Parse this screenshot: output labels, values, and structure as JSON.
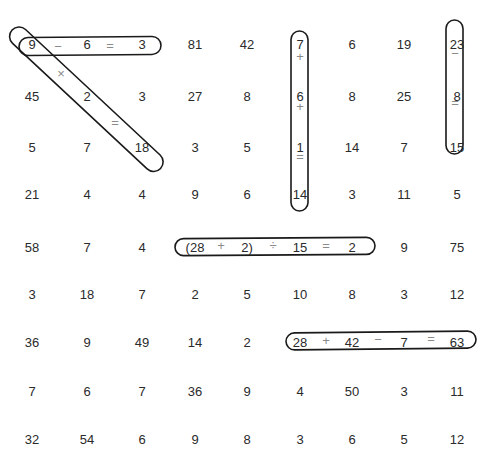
{
  "puzzle": {
    "type": "number-search-equations",
    "columns_x": [
      32,
      87,
      142,
      195,
      247,
      300,
      352,
      404,
      457
    ],
    "rows_y": [
      45,
      97,
      148,
      195,
      248,
      295,
      343,
      392,
      440
    ],
    "grid": [
      [
        "9",
        "6",
        "3",
        "81",
        "42",
        "7",
        "6",
        "19",
        "23"
      ],
      [
        "45",
        "2",
        "3",
        "27",
        "8",
        "6",
        "8",
        "25",
        "8"
      ],
      [
        "5",
        "7",
        "18",
        "3",
        "5",
        "1",
        "14",
        "7",
        "15"
      ],
      [
        "21",
        "4",
        "4",
        "9",
        "6",
        "14",
        "3",
        "11",
        "5"
      ],
      [
        "58",
        "7",
        "4",
        "(28",
        "2)",
        "15",
        "2",
        "9",
        "75"
      ],
      [
        "3",
        "18",
        "7",
        "2",
        "5",
        "10",
        "8",
        "3",
        "12"
      ],
      [
        "36",
        "9",
        "49",
        "14",
        "2",
        "28",
        "42",
        "7",
        "63"
      ],
      [
        "7",
        "6",
        "7",
        "36",
        "9",
        "4",
        "50",
        "3",
        "11"
      ],
      [
        "32",
        "54",
        "6",
        "9",
        "8",
        "3",
        "6",
        "5",
        "12"
      ]
    ],
    "found_equations": [
      {
        "id": "eq-1",
        "text": "9 − 6 = 3",
        "direction": "horizontal",
        "operators": [
          {
            "symbol": "−",
            "x": 58,
            "y": 47
          },
          {
            "symbol": "=",
            "x": 110,
            "y": 46
          }
        ]
      },
      {
        "id": "eq-2",
        "text": "9 × 2 = 18",
        "direction": "diagonal",
        "operators": [
          {
            "symbol": "×",
            "x": 61,
            "y": 74
          },
          {
            "symbol": "=",
            "x": 115,
            "y": 123
          }
        ]
      },
      {
        "id": "eq-3",
        "text": "7 + 6 + 1 = 14",
        "direction": "vertical",
        "operators": [
          {
            "symbol": "+",
            "x": 300,
            "y": 57
          },
          {
            "symbol": "+",
            "x": 300,
            "y": 107
          },
          {
            "symbol": "=",
            "x": 300,
            "y": 157
          }
        ]
      },
      {
        "id": "eq-4",
        "text": "23 − 8 = 15",
        "direction": "vertical",
        "operators": [
          {
            "symbol": "−",
            "x": 455,
            "y": 54
          },
          {
            "symbol": "=",
            "x": 455,
            "y": 103
          }
        ]
      },
      {
        "id": "eq-5",
        "text": "(28 + 2) ÷ 15 = 2",
        "direction": "horizontal",
        "operators": [
          {
            "symbol": "+",
            "x": 221,
            "y": 246
          },
          {
            "symbol": "÷",
            "x": 273,
            "y": 246
          },
          {
            "symbol": "=",
            "x": 326,
            "y": 246
          }
        ]
      },
      {
        "id": "eq-6",
        "text": "28 + 42 − 7 = 63",
        "direction": "horizontal",
        "operators": [
          {
            "symbol": "+",
            "x": 326,
            "y": 341
          },
          {
            "symbol": "−",
            "x": 378,
            "y": 340
          },
          {
            "symbol": "=",
            "x": 431,
            "y": 339
          }
        ]
      }
    ]
  }
}
